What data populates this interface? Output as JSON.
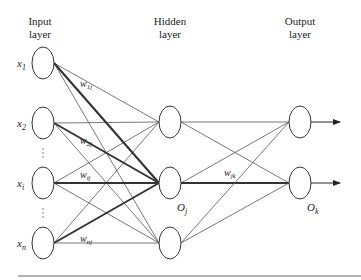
{
  "layers": {
    "input": {
      "title_line1": "Input",
      "title_line2": "layer"
    },
    "hidden": {
      "title_line1": "Hidden",
      "title_line2": "layer"
    },
    "output": {
      "title_line1": "Output",
      "title_line2": "layer"
    }
  },
  "input_nodes": [
    {
      "var": "x",
      "sub": "1"
    },
    {
      "var": "x",
      "sub": "2"
    },
    {
      "var": "x",
      "sub": "i"
    },
    {
      "var": "x",
      "sub": "n"
    }
  ],
  "hidden_labels": {
    "oj_var": "O",
    "oj_sub": "j"
  },
  "output_labels": {
    "ok_var": "O",
    "ok_sub": "k"
  },
  "weights": {
    "w1j": {
      "var": "w",
      "sub": "1j"
    },
    "w2j": {
      "var": "w",
      "sub": "2j"
    },
    "wij": {
      "var": "w",
      "sub": "ij"
    },
    "wnj": {
      "var": "w",
      "sub": "nj"
    },
    "wjk": {
      "var": "w",
      "sub": "jk"
    }
  },
  "ellipsis": "⋮"
}
